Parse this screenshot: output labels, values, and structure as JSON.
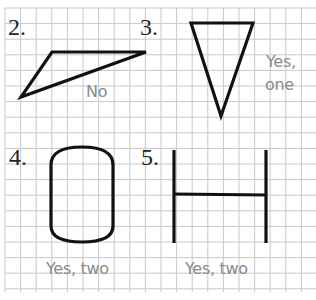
{
  "problems": [
    {
      "number": "2.",
      "shape": "obtuse-triangle",
      "answer": "No"
    },
    {
      "number": "3.",
      "shape": "isosceles-triangle",
      "answer_line1": "Yes,",
      "answer_line2": "one"
    },
    {
      "number": "4.",
      "shape": "rounded-rectangle",
      "answer": "Yes, two"
    },
    {
      "number": "5.",
      "shape": "h-shape",
      "answer": "Yes, two"
    }
  ],
  "colors": {
    "grid": "#c8c8c8",
    "shape": "#111111",
    "answer": "#8a8a8a",
    "number": "#222222"
  }
}
